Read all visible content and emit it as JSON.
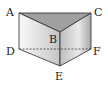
{
  "diagram": {
    "type": "triangular-prism",
    "labels": {
      "A": "A",
      "B": "B",
      "C": "C",
      "D": "D",
      "E": "E",
      "F": "F"
    },
    "hidden_edge": "DF",
    "colors": {
      "edge": "#2a2a2a",
      "top_face": "#9a9a9a",
      "left_face_light": "#f4f4f4",
      "left_face_dark": "#c8c8c8",
      "right_face_light": "#e8e8e8",
      "right_face_dark": "#b0b0b0"
    }
  }
}
